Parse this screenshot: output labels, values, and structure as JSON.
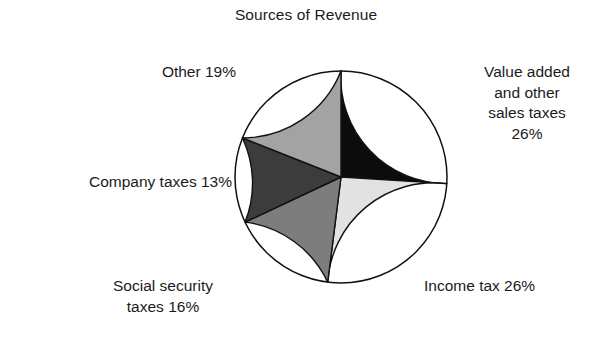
{
  "chart_data": {
    "type": "pie",
    "title": "Sources of Revenue",
    "xlabel": "",
    "ylabel": "",
    "legend_position": "none",
    "grid": false,
    "start_angle_deg": 90,
    "direction": "clockwise",
    "categories": [
      "Value added and other sales taxes",
      "Income tax",
      "Social security taxes",
      "Company taxes",
      "Other"
    ],
    "values": [
      26,
      26,
      16,
      13,
      19
    ],
    "value_unit": "%",
    "colors": [
      "#0c0c0c",
      "#e2e2e2",
      "#7d7d7d",
      "#3c3c3c",
      "#a3a3a3"
    ],
    "slices": [
      {
        "name": "Value added and other sales taxes",
        "value": 26,
        "color": "#0c0c0c",
        "label_lines": [
          "Value added",
          "and other",
          "sales taxes",
          "26%"
        ],
        "label_text": "Value added\nand other\nsales taxes\n26%"
      },
      {
        "name": "Income tax",
        "value": 26,
        "color": "#e2e2e2",
        "label_lines": [
          "Income tax 26%"
        ],
        "label_text": "Income tax 26%"
      },
      {
        "name": "Social security taxes",
        "value": 16,
        "color": "#7d7d7d",
        "label_lines": [
          "Social security",
          "taxes 16%"
        ],
        "label_text": "Social security\ntaxes 16%"
      },
      {
        "name": "Company taxes",
        "value": 13,
        "color": "#3c3c3c",
        "label_lines": [
          "Company taxes 13%"
        ],
        "label_text": "Company taxes 13%"
      },
      {
        "name": "Other",
        "value": 19,
        "color": "#a3a3a3",
        "label_lines": [
          "Other 19%"
        ],
        "label_text": "Other 19%"
      }
    ]
  },
  "figure": {
    "title": "Sources of Revenue",
    "background_color": "#ffffff",
    "outline_color": "#111111"
  }
}
